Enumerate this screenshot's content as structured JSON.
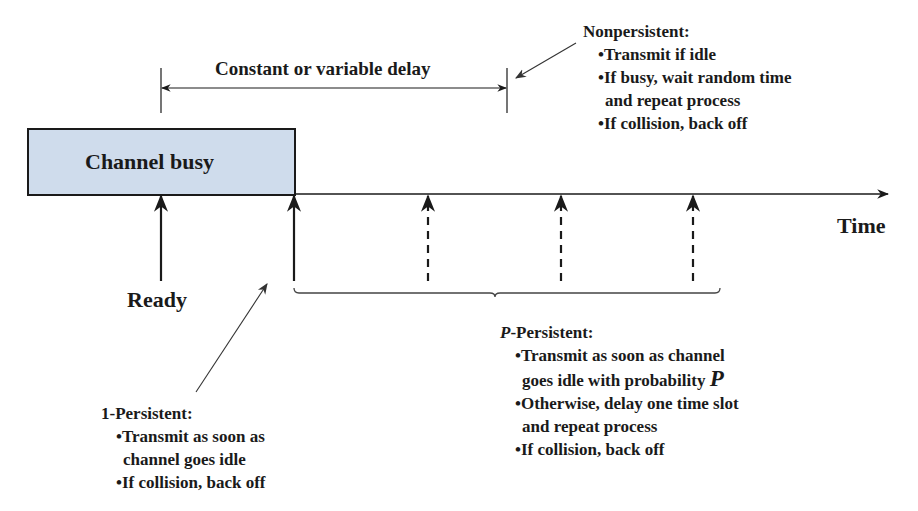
{
  "diagram": {
    "channel_busy_label": "Channel busy",
    "time_label": "Time",
    "ready_label": "Ready",
    "delay_label": "Constant or variable delay",
    "nonpersistent": {
      "title": "Nonpersistent:",
      "items": [
        "•Transmit if idle",
        "•If busy, wait random time",
        "and repeat process",
        "•If collision, back off"
      ]
    },
    "one_persistent": {
      "title": "1-Persistent:",
      "items": [
        "•Transmit as soon as",
        "channel goes idle",
        "•If collision, back off"
      ]
    },
    "p_persistent": {
      "title_p": "P",
      "title_rest": "-Persistent:",
      "items": [
        "•Transmit as soon as channel",
        "goes idle with probability ",
        "P",
        "•Otherwise, delay one time slot",
        "and repeat process",
        "•If collision, back off"
      ]
    },
    "colors": {
      "busy_fill": "#cfdcec",
      "line": "#1a1a1a"
    }
  }
}
